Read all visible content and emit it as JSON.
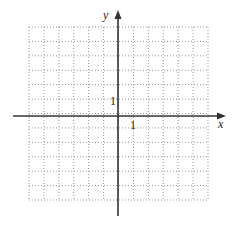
{
  "chart_data": {
    "type": "scatter",
    "title": "",
    "xlabel": "x",
    "ylabel": "y",
    "xlim": [
      -6,
      6
    ],
    "ylim": [
      -6,
      6
    ],
    "grid": true,
    "grid_style": "dotted",
    "grid_cells": 12,
    "tick_labels": {
      "x": [
        "1"
      ],
      "y": [
        "1"
      ]
    },
    "series": []
  },
  "axes": {
    "x_label": "x",
    "y_label": "y",
    "x_unit_label": "1",
    "y_unit_label": "1"
  },
  "colors": {
    "axis": "#333333",
    "grid": "#9a9a9a",
    "text": "#222222"
  }
}
